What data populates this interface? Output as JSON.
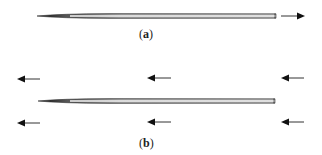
{
  "figure": {
    "panels": [
      {
        "id": "a",
        "label": "a",
        "label_text": "(a)",
        "needle": {
          "x1": 37,
          "x2": 276,
          "y": 16
        },
        "arrows": [
          {
            "direction": "right",
            "x1": 281,
            "x2": 305,
            "y": 16
          }
        ]
      },
      {
        "id": "b",
        "label": "b",
        "label_text": "(b)",
        "needle": {
          "x1": 38,
          "x2": 275,
          "y": 101
        },
        "arrows": [
          {
            "direction": "left",
            "x1": 17,
            "x2": 40,
            "y": 79
          },
          {
            "direction": "left",
            "x1": 147,
            "x2": 171,
            "y": 78
          },
          {
            "direction": "left",
            "x1": 281,
            "x2": 304,
            "y": 78
          },
          {
            "direction": "left",
            "x1": 17,
            "x2": 40,
            "y": 123
          },
          {
            "direction": "left",
            "x1": 147,
            "x2": 171,
            "y": 122
          },
          {
            "direction": "left",
            "x1": 281,
            "x2": 304,
            "y": 122
          }
        ]
      }
    ],
    "colors": {
      "stroke": "#1a1a1a",
      "needle_dark": "#222222",
      "needle_light": "#d8d8d8",
      "background": "#ffffff"
    }
  }
}
